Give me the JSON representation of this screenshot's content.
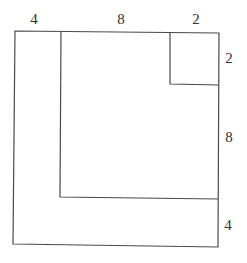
{
  "diagram": {
    "top_labels": [
      "4",
      "8",
      "2"
    ],
    "right_labels": [
      "2",
      "8",
      "4"
    ],
    "shapes": [
      {
        "name": "outer-square",
        "side": 14
      },
      {
        "name": "middle-square",
        "side": 10
      },
      {
        "name": "small-square",
        "side": 2
      }
    ],
    "colors": {
      "stroke": "#4a4a4a",
      "text": "#333333",
      "background": "#ffffff"
    }
  }
}
